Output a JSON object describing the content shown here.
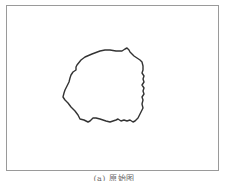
{
  "figure": {
    "frame": {
      "border_color": "#9a9a9a",
      "background": "#ffffff"
    },
    "shape": {
      "description": "irregular closed contour outline",
      "stroke_color": "#333333",
      "points": "77,65 81,60 85,57 92,54 100,51 105,50 110,50 116,51 122,51 125,49 127,48 129,50 130,52 134,56 137,58 140,60 142,62 143,66 143,70 142,73 144,76 143,79 144,82 142,85 144,88 143,91 144,94 142,97 143,100 142,104 143,108 142,110 140,114 138,118 135,121 133,122 130,120 127,121 124,120 121,121 118,119 116,120 113,121 110,122 106,121 100,119 96,118 93,118 90,121 88,122 84,120 80,119 78,115 75,111 71,107 68,103 65,100 63,97 64,93 65,90 67,86 69,82 70,78 71,75 73,72 76,70 76,67 77,65"
    },
    "caption": "(a) 原始图"
  }
}
